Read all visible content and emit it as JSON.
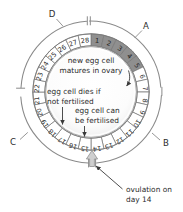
{
  "diagram": {
    "outer_labels": [
      {
        "id": "A",
        "text": "A",
        "x": 146,
        "y": 26
      },
      {
        "id": "B",
        "text": "B",
        "x": 164,
        "y": 143
      },
      {
        "id": "C",
        "text": "C",
        "x": 13,
        "y": 142
      },
      {
        "id": "D",
        "text": "D",
        "x": 52,
        "y": 14
      }
    ],
    "days": [
      {
        "n": "1",
        "shaded": true
      },
      {
        "n": "2",
        "shaded": true
      },
      {
        "n": "3",
        "shaded": true
      },
      {
        "n": "4",
        "shaded": true
      },
      {
        "n": "5",
        "shaded": true
      },
      {
        "n": "6",
        "shaded": false
      },
      {
        "n": "7",
        "shaded": false
      },
      {
        "n": "8",
        "shaded": false
      },
      {
        "n": "9",
        "shaded": false
      },
      {
        "n": "10",
        "shaded": false
      },
      {
        "n": "11",
        "shaded": false
      },
      {
        "n": "12",
        "shaded": false
      },
      {
        "n": "13",
        "shaded": false
      },
      {
        "n": "14",
        "shaded": false
      },
      {
        "n": "15",
        "shaded": false
      },
      {
        "n": "16",
        "shaded": false
      },
      {
        "n": "17",
        "shaded": false
      },
      {
        "n": "18",
        "shaded": false
      },
      {
        "n": "19",
        "shaded": false
      },
      {
        "n": "20",
        "shaded": false
      },
      {
        "n": "21",
        "shaded": false
      },
      {
        "n": "22",
        "shaded": false
      },
      {
        "n": "23",
        "shaded": false
      },
      {
        "n": "24",
        "shaded": false
      },
      {
        "n": "25",
        "shaded": false
      },
      {
        "n": "26",
        "shaded": false
      },
      {
        "n": "27",
        "shaded": false
      },
      {
        "n": "28",
        "shaded": false
      }
    ],
    "annotations": {
      "new_egg": {
        "line1": "new egg cell",
        "line2": "matures in ovary"
      },
      "dies": {
        "line1": "egg cell dies if",
        "line2": "not fertilised"
      },
      "fertilised": {
        "line1": "egg cell can",
        "line2": "be fertilised"
      },
      "ovulation": {
        "line1": "ovulation on",
        "line2": "day 14"
      }
    },
    "colors": {
      "shaded_day": "#8f8f8f",
      "unshaded_day": "#ffffff",
      "ring_stroke": "#7a7a7a",
      "outer_stroke": "#8a8a8a",
      "text": "#2b2b2b",
      "center_fill": "#fdfdfd"
    }
  }
}
